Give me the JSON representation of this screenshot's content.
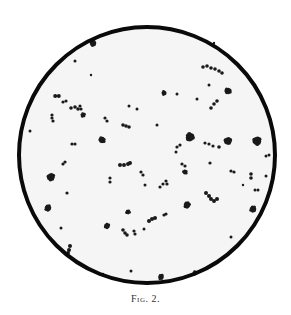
{
  "figure": {
    "caption_prefix": "Fig.",
    "caption_number": "2.",
    "caption_full": "Fig. 2."
  },
  "field": {
    "description": "Circular microscope field of view showing scattered micrococci, singly, in pairs, short chains and small clumps",
    "center": [
      147,
      155
    ],
    "radius": 128,
    "ring_width": 4,
    "ring_color": "#0a0a0a",
    "inside_color": "#f5f5f5",
    "outside_color": "#ffffff",
    "organism_color": "#1a1a1a"
  },
  "organisms": [
    {
      "type": "clump",
      "x": 93,
      "y": 43,
      "r": 4
    },
    {
      "type": "single",
      "x": 75,
      "y": 61,
      "r": 1.5
    },
    {
      "type": "single",
      "x": 91,
      "y": 75,
      "r": 1.2
    },
    {
      "type": "pair",
      "x": 57,
      "y": 96,
      "r": 2
    },
    {
      "type": "chain",
      "points": [
        [
          63,
          102
        ],
        [
          66,
          101
        ]
      ],
      "r": 1.6
    },
    {
      "type": "chain",
      "points": [
        [
          71,
          108
        ],
        [
          75,
          107
        ],
        [
          78,
          109
        ]
      ],
      "r": 1.8
    },
    {
      "type": "chain",
      "points": [
        [
          80,
          106
        ],
        [
          81,
          109
        ]
      ],
      "r": 1.6
    },
    {
      "type": "clump",
      "x": 83,
      "y": 115,
      "r": 3
    },
    {
      "type": "chain",
      "points": [
        [
          52,
          115
        ],
        [
          52,
          118
        ],
        [
          53,
          121
        ]
      ],
      "r": 1.6
    },
    {
      "type": "chain",
      "points": [
        [
          105,
          118
        ],
        [
          107,
          121
        ]
      ],
      "r": 1.6
    },
    {
      "type": "single",
      "x": 129,
      "y": 106,
      "r": 1.5
    },
    {
      "type": "single",
      "x": 137,
      "y": 109,
      "r": 1.5
    },
    {
      "type": "chain",
      "points": [
        [
          123,
          125
        ],
        [
          126,
          126
        ],
        [
          129,
          127
        ]
      ],
      "r": 1.8
    },
    {
      "type": "single",
      "x": 157,
      "y": 125,
      "r": 1.5
    },
    {
      "type": "single",
      "x": 30,
      "y": 131,
      "r": 1.5
    },
    {
      "type": "clump",
      "x": 102,
      "y": 140,
      "r": 4
    },
    {
      "type": "chain",
      "points": [
        [
          72,
          144
        ],
        [
          75,
          144
        ]
      ],
      "r": 1.6
    },
    {
      "type": "clump",
      "x": 164,
      "y": 93,
      "r": 3
    },
    {
      "type": "single",
      "x": 177,
      "y": 94,
      "r": 1.5
    },
    {
      "type": "single",
      "x": 197,
      "y": 99,
      "r": 1.5
    },
    {
      "type": "chain",
      "points": [
        [
          203,
          67
        ],
        [
          207,
          66
        ],
        [
          211,
          68
        ],
        [
          215,
          69
        ],
        [
          219,
          71
        ],
        [
          222,
          73
        ]
      ],
      "r": 1.8
    },
    {
      "type": "single",
      "x": 209,
      "y": 85,
      "r": 1.5
    },
    {
      "type": "clump",
      "x": 228,
      "y": 91,
      "r": 4
    },
    {
      "type": "chain",
      "points": [
        [
          211,
          108
        ],
        [
          214,
          104
        ],
        [
          217,
          101
        ]
      ],
      "r": 1.8
    },
    {
      "type": "clump",
      "x": 190,
      "y": 137,
      "r": 5
    },
    {
      "type": "chain",
      "points": [
        [
          205,
          143
        ],
        [
          209,
          144
        ],
        [
          213,
          146
        ]
      ],
      "r": 1.6
    },
    {
      "type": "single",
      "x": 219,
      "y": 147,
      "r": 1.8
    },
    {
      "type": "clump",
      "x": 228,
      "y": 141,
      "r": 4.5
    },
    {
      "type": "clump",
      "x": 257,
      "y": 141,
      "r": 5
    },
    {
      "type": "chain",
      "points": [
        [
          177,
          147
        ],
        [
          180,
          145
        ]
      ],
      "r": 1.6
    },
    {
      "type": "single",
      "x": 176,
      "y": 152,
      "r": 1.5
    },
    {
      "type": "chain",
      "points": [
        [
          266,
          156
        ],
        [
          269,
          155
        ]
      ],
      "r": 1.5
    },
    {
      "type": "chain",
      "points": [
        [
          120,
          165
        ],
        [
          124,
          165
        ],
        [
          128,
          164
        ],
        [
          130,
          163
        ]
      ],
      "r": 2
    },
    {
      "type": "chain",
      "points": [
        [
          63,
          164
        ],
        [
          65,
          162
        ]
      ],
      "r": 1.6
    },
    {
      "type": "clump",
      "x": 51,
      "y": 177,
      "r": 4.5
    },
    {
      "type": "chain",
      "points": [
        [
          141,
          172
        ],
        [
          143,
          175
        ]
      ],
      "r": 1.6
    },
    {
      "type": "chain",
      "points": [
        [
          110,
          178
        ],
        [
          110,
          182
        ]
      ],
      "r": 1.6
    },
    {
      "type": "single",
      "x": 145,
      "y": 185,
      "r": 1.5
    },
    {
      "type": "chain",
      "points": [
        [
          160,
          187
        ],
        [
          163,
          184
        ]
      ],
      "r": 1.6
    },
    {
      "type": "chain",
      "points": [
        [
          166,
          181
        ],
        [
          167,
          184
        ]
      ],
      "r": 1.6
    },
    {
      "type": "chain",
      "points": [
        [
          182,
          164
        ],
        [
          185,
          166
        ]
      ],
      "r": 1.6
    },
    {
      "type": "clump",
      "x": 185,
      "y": 172,
      "r": 3
    },
    {
      "type": "single",
      "x": 210,
      "y": 163,
      "r": 1.6
    },
    {
      "type": "chain",
      "points": [
        [
          231,
          171
        ],
        [
          234,
          172
        ]
      ],
      "r": 1.6
    },
    {
      "type": "chain",
      "points": [
        [
          251,
          174
        ],
        [
          251,
          178
        ]
      ],
      "r": 1.8
    },
    {
      "type": "single",
      "x": 266,
      "y": 176,
      "r": 1.5
    },
    {
      "type": "single",
      "x": 243,
      "y": 185,
      "r": 1.2
    },
    {
      "type": "chain",
      "points": [
        [
          255,
          190
        ],
        [
          258,
          190
        ]
      ],
      "r": 1.5
    },
    {
      "type": "single",
      "x": 67,
      "y": 193,
      "r": 1.6
    },
    {
      "type": "chain",
      "points": [
        [
          206,
          193
        ],
        [
          209,
          196
        ],
        [
          211,
          199
        ],
        [
          214,
          201
        ],
        [
          217,
          199
        ]
      ],
      "r": 2
    },
    {
      "type": "clump",
      "x": 187,
      "y": 205,
      "r": 4
    },
    {
      "type": "clump",
      "x": 48,
      "y": 208,
      "r": 4
    },
    {
      "type": "clump",
      "x": 253,
      "y": 209,
      "r": 4
    },
    {
      "type": "clump",
      "x": 128,
      "y": 212,
      "r": 3
    },
    {
      "type": "chain",
      "points": [
        [
          149,
          221
        ],
        [
          152,
          219
        ],
        [
          155,
          218
        ]
      ],
      "r": 2
    },
    {
      "type": "chain",
      "points": [
        [
          164,
          215
        ],
        [
          166,
          214
        ]
      ],
      "r": 1.6
    },
    {
      "type": "clump",
      "x": 107,
      "y": 226,
      "r": 3.5
    },
    {
      "type": "single",
      "x": 61,
      "y": 228,
      "r": 1.5
    },
    {
      "type": "chain",
      "points": [
        [
          123,
          230
        ],
        [
          125,
          233
        ],
        [
          127,
          235
        ]
      ],
      "r": 1.8
    },
    {
      "type": "chain",
      "points": [
        [
          134,
          231
        ],
        [
          135,
          234
        ]
      ],
      "r": 1.6
    },
    {
      "type": "single",
      "x": 144,
      "y": 229,
      "r": 1.5
    },
    {
      "type": "single",
      "x": 231,
      "y": 237,
      "r": 1.5
    },
    {
      "type": "chain",
      "points": [
        [
          70,
          246
        ],
        [
          69,
          250
        ],
        [
          68,
          253
        ]
      ],
      "r": 2
    },
    {
      "type": "single",
      "x": 103,
      "y": 274,
      "r": 1.2
    },
    {
      "type": "single",
      "x": 131,
      "y": 271,
      "r": 1.5
    },
    {
      "type": "clump",
      "x": 161,
      "y": 277,
      "r": 3.5
    },
    {
      "type": "clump",
      "x": 195,
      "y": 273,
      "r": 3
    },
    {
      "type": "single",
      "x": 214,
      "y": 43,
      "r": 1.2
    }
  ]
}
